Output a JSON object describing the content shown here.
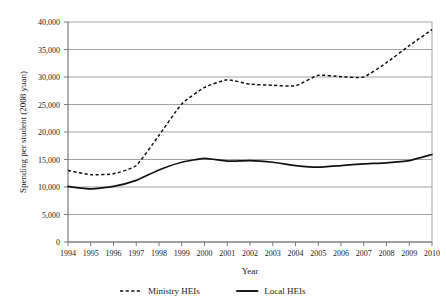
{
  "chart_data": {
    "type": "line",
    "title": "",
    "xlabel": "Year",
    "ylabel": "Spending per student (2008 yuan)",
    "x": [
      1994,
      1995,
      1996,
      1997,
      1998,
      1999,
      2000,
      2001,
      2002,
      2003,
      2004,
      2005,
      2006,
      2007,
      2008,
      2009,
      2010
    ],
    "categories": [
      "1994",
      "1995",
      "1996",
      "1997",
      "1998",
      "1999",
      "2000",
      "2001",
      "2002",
      "2003",
      "2004",
      "2005",
      "2006",
      "2007",
      "2008",
      "2009",
      "2010"
    ],
    "series": [
      {
        "name": "Ministry HEIs",
        "style": "dashed",
        "color": "#111111",
        "values": [
          13000,
          12250,
          12400,
          13900,
          19400,
          25100,
          28100,
          29500,
          28700,
          28500,
          28400,
          30300,
          30050,
          30000,
          32600,
          35700,
          38600
        ]
      },
      {
        "name": "Local HEIs",
        "style": "solid",
        "color": "#111111",
        "values": [
          10100,
          9650,
          10100,
          11200,
          13100,
          14500,
          15200,
          14700,
          14800,
          14500,
          13900,
          13600,
          13900,
          14200,
          14400,
          14800,
          15900
        ]
      }
    ],
    "ylim": [
      0,
      40000
    ],
    "yticks": [
      0,
      5000,
      10000,
      15000,
      20000,
      25000,
      30000,
      35000,
      40000
    ],
    "ytick_labels": [
      "0",
      "5,000",
      "10,000",
      "15,000",
      "20,000",
      "25,000",
      "30,000",
      "35,000",
      "40,000"
    ],
    "xlim": [
      1994,
      2010
    ],
    "grid": true,
    "grid_axis": "y",
    "legend_position": "bottom",
    "legend_entries": [
      {
        "label": "Ministry HEIs",
        "style": "dashed"
      },
      {
        "label": "Local HEIs",
        "style": "solid"
      }
    ],
    "background_color": "#ffffff",
    "gridline_color": "#9a9a9a"
  }
}
